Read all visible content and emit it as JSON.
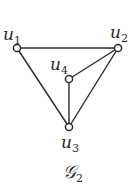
{
  "graph": {
    "caption": "𝒢",
    "caption_sub": "2",
    "nodes": [
      {
        "id": "u1",
        "label": "u",
        "sub": "1",
        "x": 17,
        "y": 48
      },
      {
        "id": "u2",
        "label": "u",
        "sub": "2",
        "x": 118,
        "y": 48
      },
      {
        "id": "u3",
        "label": "u",
        "sub": "3",
        "x": 69,
        "y": 127
      },
      {
        "id": "u4",
        "label": "u",
        "sub": "4",
        "x": 69,
        "y": 79
      }
    ],
    "edges": [
      [
        "u1",
        "u2"
      ],
      [
        "u1",
        "u3"
      ],
      [
        "u2",
        "u3"
      ],
      [
        "u2",
        "u4"
      ],
      [
        "u4",
        "u3"
      ]
    ],
    "colors": {
      "stroke": "#2a2a2a",
      "background": "#ffffff"
    }
  }
}
